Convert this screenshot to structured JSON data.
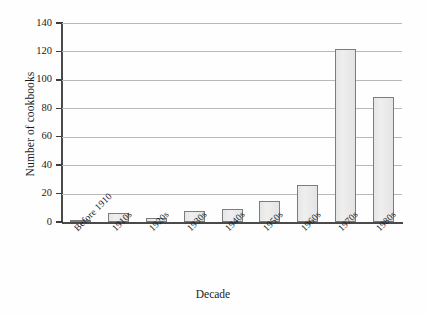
{
  "chart_data": {
    "type": "bar",
    "title": "",
    "xlabel": "Decade",
    "ylabel": "Number of cookbooks",
    "categories": [
      "Before 1910",
      "1910s",
      "1920s",
      "1930s",
      "1940s",
      "1950s",
      "1960s",
      "1970s",
      "1980s"
    ],
    "values": [
      1,
      6,
      3,
      8,
      9,
      15,
      26,
      122,
      88
    ],
    "ylim": [
      0,
      140
    ],
    "ytick_labels": [
      "0",
      "20",
      "40",
      "60",
      "80",
      "100",
      "120",
      "140"
    ],
    "ytick_values": [
      0,
      20,
      40,
      60,
      80,
      100,
      120,
      140
    ],
    "grid": true,
    "legend": "none",
    "series": [
      {
        "name": "Number of cookbooks",
        "values": [
          1,
          6,
          3,
          8,
          9,
          15,
          26,
          122,
          88
        ]
      }
    ],
    "colors": {
      "bar_fill": "#e9e9e9",
      "bar_edge": "#7c7c7c",
      "grid": "#b9b9b9",
      "axis": "#4a4a4a",
      "text": "#1a1a1a",
      "background": "#fefefe"
    }
  }
}
